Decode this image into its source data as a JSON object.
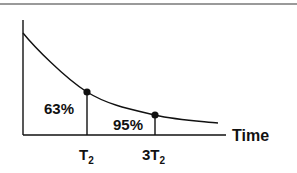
{
  "diagram": {
    "x_axis_label": "Time",
    "curve": {
      "type": "exponential-decay",
      "color": "#111111"
    },
    "markers": [
      {
        "id": "t2",
        "label": "63%",
        "tick_main": "T",
        "tick_sub": "2",
        "tick_prefix": "",
        "time_constant_multiple": 1
      },
      {
        "id": "3t2",
        "label": "95%",
        "tick_main": "T",
        "tick_sub": "2",
        "tick_prefix": "3",
        "time_constant_multiple": 3
      }
    ],
    "colors": {
      "line": "#111111",
      "rule": "#9a9a9a",
      "background": "#ffffff"
    }
  }
}
